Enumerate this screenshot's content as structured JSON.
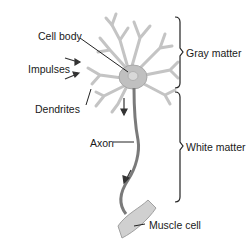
{
  "diagram": {
    "labels": {
      "cell_body": "Cell body",
      "impulses": "Impulses",
      "dendrites": "Dendrites",
      "axon": "Axon",
      "muscle_cell": "Muscle cell",
      "gray_matter": "Gray matter",
      "white_matter": "White matter"
    },
    "colors": {
      "neuron_fill": "#c8c8c8",
      "neuron_stroke": "#9a9a9a",
      "axon": "#7a7a7a",
      "text": "#1a1a1a",
      "leader_lines": "#222222"
    }
  }
}
